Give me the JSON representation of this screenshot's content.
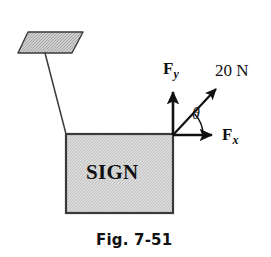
{
  "figure": {
    "caption": "Fig. 7-51",
    "sign_label": "SIGN",
    "colors": {
      "ink": "#111111",
      "sign_fill": "#d8d8d8",
      "plate_fill": "#c9c9c9",
      "background": "#ffffff"
    },
    "vectors": [
      {
        "id": "fy",
        "symbol": "F",
        "subscript": "y",
        "label": "F_y",
        "direction": "up"
      },
      {
        "id": "fx",
        "symbol": "F",
        "subscript": "x",
        "label": "F_x",
        "direction": "right"
      },
      {
        "id": "resultant",
        "label": "20 N",
        "magnitude": "20",
        "unit": "N",
        "direction": "up-right"
      }
    ],
    "angle": {
      "symbol": "θ",
      "between": "F_x and 20 N"
    },
    "parts": {
      "plate_name": "bracket-plate",
      "cable_name": "support-cable"
    }
  }
}
